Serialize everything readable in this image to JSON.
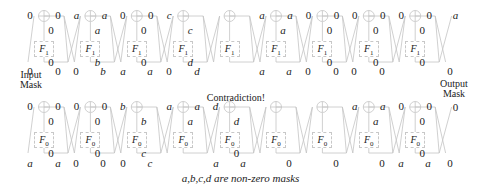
{
  "diagram": {
    "caption": "a,b,c,d are non-zero masks",
    "contradiction_label": "Contradiction!",
    "input_mask_label": [
      "Input",
      "Mask"
    ],
    "output_mask_label": [
      "Output",
      "Mask"
    ],
    "top_function_label": "F",
    "top_function_sub": "1",
    "bottom_function_label": "F",
    "bottom_function_sub": "0",
    "top_half": {
      "rounds": [
        {
          "left": "0",
          "right": "0",
          "f_in": "0",
          "f_out": "0"
        },
        {
          "left": "a",
          "right": "a",
          "f_in": "a",
          "f_out": "b"
        },
        {
          "left": "0",
          "right": "0",
          "f_in": "0",
          "f_out": "0"
        },
        {
          "left": "c",
          "right": "",
          "f_in": "c",
          "f_out": "d"
        },
        {
          "left": "",
          "right": "",
          "f_in": "",
          "f_out": ""
        },
        {
          "left": "a",
          "right": "a",
          "f_in": "a",
          "f_out": ""
        },
        {
          "left": "0",
          "right": "0",
          "f_in": "0",
          "f_out": "0"
        },
        {
          "left": "0",
          "right": "0",
          "f_in": "0",
          "f_out": "0"
        },
        {
          "left": "0",
          "right": "0",
          "f_in": "0",
          "f_out": "0"
        }
      ],
      "final_right": "a",
      "mid_row": [
        "0",
        "0",
        "0",
        "b",
        "a",
        "a",
        "0",
        "d",
        "",
        "",
        "a",
        "a",
        "0",
        "0",
        "0",
        "0",
        "0"
      ]
    },
    "bottom_half": {
      "rounds": [
        {
          "left": "0",
          "right": "0",
          "f_in": "0",
          "f_out": "0"
        },
        {
          "left": "0",
          "right": "0",
          "f_in": "0",
          "f_out": "0"
        },
        {
          "left": "b",
          "right": "",
          "f_in": "b",
          "f_out": "c"
        },
        {
          "left": "a",
          "right": "a",
          "f_in": "a",
          "f_out": ""
        },
        {
          "left": "d",
          "right": "",
          "f_in": "d",
          "f_out": "0"
        },
        {
          "left": "",
          "right": "",
          "f_in": "",
          "f_out": ""
        },
        {
          "left": "",
          "right": "",
          "f_in": "",
          "f_out": ""
        },
        {
          "left": "a",
          "right": "a",
          "f_in": "a",
          "f_out": ""
        },
        {
          "left": "0",
          "right": "0",
          "f_in": "0",
          "f_out": "0"
        }
      ],
      "final_right": "0",
      "bottom_row": [
        "a",
        "a",
        "0",
        "0",
        "0",
        "c",
        "",
        "",
        "a",
        "a",
        "0",
        "",
        "",
        "0",
        "",
        "",
        "0",
        "a",
        "a",
        "0"
      ]
    },
    "colors": {
      "lines": "#c4c4c4",
      "text": "#222222",
      "box_border": "#c8c8c8"
    }
  }
}
